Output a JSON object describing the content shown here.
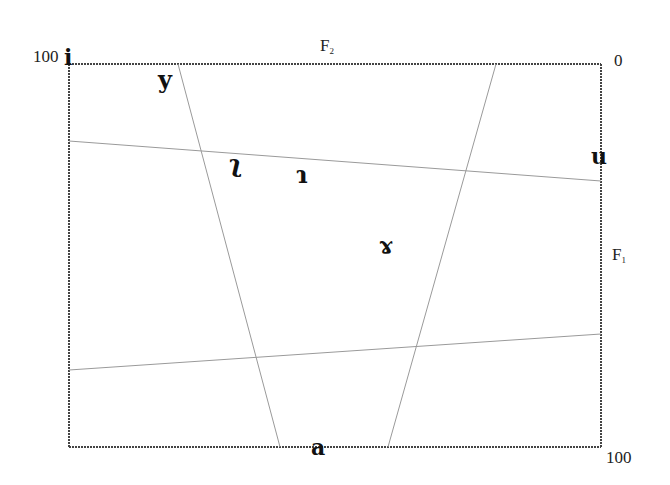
{
  "diagram": {
    "type": "vowel-chart",
    "axes": {
      "top": {
        "name": "F",
        "subscript": "2",
        "left_value": "100",
        "right_value": "0"
      },
      "right": {
        "name": "F",
        "subscript": "1",
        "top_value": "0",
        "bottom_value": "100"
      }
    },
    "vowels": [
      {
        "symbol": "i",
        "label": "vowel-i"
      },
      {
        "symbol": "y",
        "label": "vowel-y"
      },
      {
        "symbol": "ʅ",
        "label": "vowel-retroflex-apical"
      },
      {
        "symbol": "ɿ",
        "label": "vowel-dental-apical"
      },
      {
        "symbol": "u",
        "label": "vowel-u"
      },
      {
        "symbol": "ɤ",
        "label": "vowel-ram-horns"
      },
      {
        "symbol": "a",
        "label": "vowel-a"
      }
    ],
    "frame": {
      "x1": 69,
      "y1": 64,
      "x2": 601,
      "y2": 447
    },
    "guide_lines": [
      {
        "name": "upper-horizontal",
        "x1": 69,
        "y1": 141,
        "x2": 601,
        "y2": 181
      },
      {
        "name": "lower-horizontal",
        "x1": 69,
        "y1": 370,
        "x2": 601,
        "y2": 334
      },
      {
        "name": "left-diagonal",
        "x1": 178,
        "y1": 64,
        "x2": 280,
        "y2": 447
      },
      {
        "name": "right-diagonal",
        "x1": 496,
        "y1": 64,
        "x2": 388,
        "y2": 447
      }
    ],
    "colors": {
      "frame": "#444444",
      "guides": "#9a9a9a",
      "text": "#111111"
    }
  }
}
